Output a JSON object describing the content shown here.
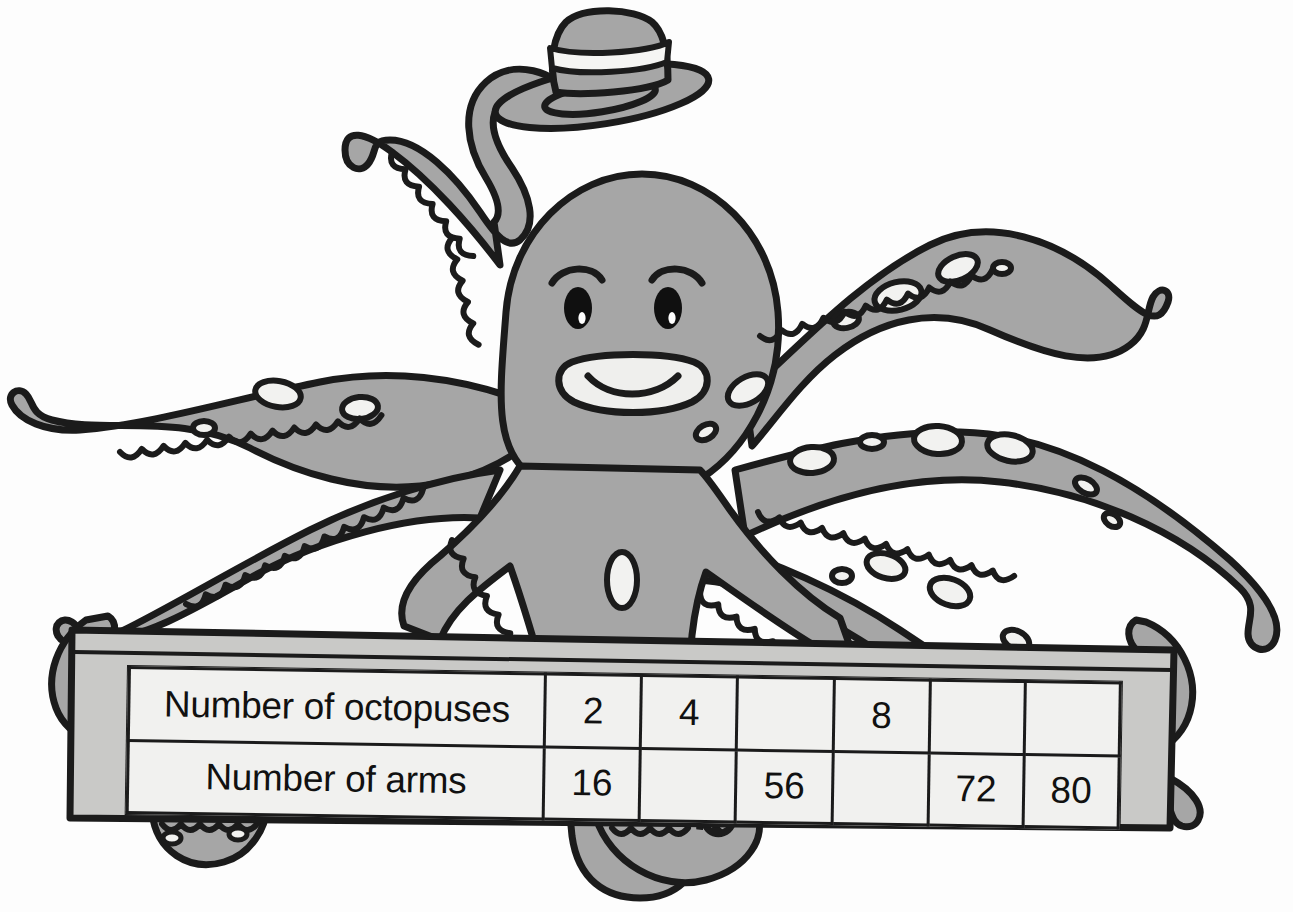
{
  "page": {
    "title": "Octopus arms table worksheet",
    "background_color": "#fdfdfd"
  },
  "illustration": {
    "name": "octopus-with-top-hat",
    "description": "Cartoon octopus wearing a striped top hat, holding a banner",
    "body_color": "#a6a6a6",
    "outline_color": "#1b1b1b",
    "sucker_color": "#f2f2f0",
    "hat": {
      "name": "top-hat",
      "band_color": "#f5f5f3",
      "crown_color": "#a6a6a6"
    },
    "face": {
      "eyes": 2,
      "eye_color": "#101010",
      "highlight_color": "#ffffff",
      "mouth": "smile"
    },
    "arm_count": 8
  },
  "banner": {
    "name": "scroll-banner",
    "fill_color": "#c9c9c7",
    "border_color": "#1b1b1b"
  },
  "table": {
    "caption": "Number of octopuses and number of arms",
    "row_label_header": "",
    "fill_color": "#f1f1ef",
    "empty_fill_color": "#b4b4b2",
    "border_color": "#1b1b1b",
    "rows": [
      {
        "label": "Number of octopuses",
        "cells": [
          "2",
          "4",
          "",
          "8",
          "",
          ""
        ]
      },
      {
        "label": "Number of arms",
        "cells": [
          "16",
          "",
          "56",
          "",
          "72",
          "80"
        ]
      }
    ]
  },
  "chart_data": {
    "type": "table",
    "categories": [
      "col1",
      "col2",
      "col3",
      "col4",
      "col5",
      "col6"
    ],
    "series": [
      {
        "name": "Number of octopuses",
        "values": [
          "2",
          "4",
          "",
          "8",
          "",
          ""
        ]
      },
      {
        "name": "Number of arms",
        "values": [
          "16",
          "",
          "56",
          "",
          "72",
          "80"
        ]
      }
    ]
  }
}
